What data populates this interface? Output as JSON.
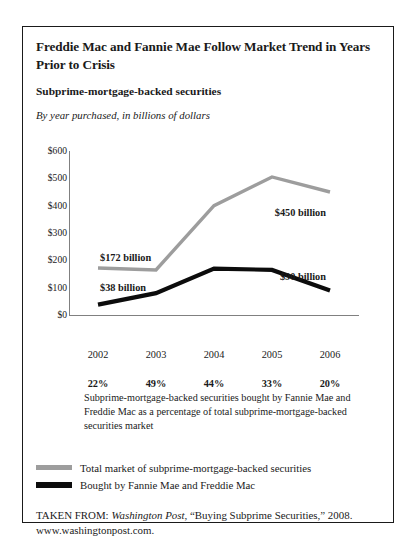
{
  "figure": {
    "title": "Freddie Mac and Fannie Mae Follow Market Trend in Years Prior to Crisis",
    "subtitle": "Subprime-mortgage-backed securities",
    "note": "By year purchased, in billions of dollars",
    "footnote": "Subprime-mortgage-backed securities bought by Fannie Mae and Freddie Mac as a percentage of total subprime-mortgage-backed securities market"
  },
  "source": {
    "prefix": "TAKEN FROM: ",
    "publication": "Washington Post",
    "article": ", “Buying Subprime Securities,” 2008.",
    "url": "www.washingtonpost.com."
  },
  "legend": [
    {
      "label": "Total market of subprime-mortgage-backed securities",
      "color": "#9d9d9d",
      "weight": "thin"
    },
    {
      "label": "Bought by Fannie Mae and Freddie Mac",
      "color": "#0c0c0c",
      "weight": "thick"
    }
  ],
  "annotations": [
    {
      "text": "$172 billion",
      "anchor": "left-gray"
    },
    {
      "text": "$38 billion",
      "anchor": "left-black"
    },
    {
      "text": "$450 billion",
      "anchor": "right-gray"
    },
    {
      "text": "$90 billion",
      "anchor": "right-black"
    }
  ],
  "chart_data": {
    "type": "line",
    "title": "Subprime-mortgage-backed securities",
    "subtitle": "By year purchased, in billions of dollars",
    "xlabel": "",
    "ylabel": "",
    "categories": [
      "2002",
      "2003",
      "2004",
      "2005",
      "2006"
    ],
    "ytick_labels": [
      "$600",
      "$500",
      "$400",
      "$300",
      "$200",
      "$100",
      "$0"
    ],
    "yticks": [
      600,
      500,
      400,
      300,
      200,
      100,
      0
    ],
    "ylim": [
      0,
      600
    ],
    "grid": false,
    "legend_position": "below",
    "series": [
      {
        "name": "Total market of subprime-mortgage-backed securities",
        "color": "#9d9d9d",
        "values": [
          172,
          165,
          400,
          505,
          450
        ]
      },
      {
        "name": "Bought by Fannie Mae and Freddie Mac",
        "color": "#0c0c0c",
        "values": [
          38,
          80,
          170,
          165,
          90
        ]
      }
    ],
    "secondary_row": {
      "label": "Share of total market",
      "values": [
        "22%",
        "49%",
        "44%",
        "33%",
        "20%"
      ]
    }
  }
}
